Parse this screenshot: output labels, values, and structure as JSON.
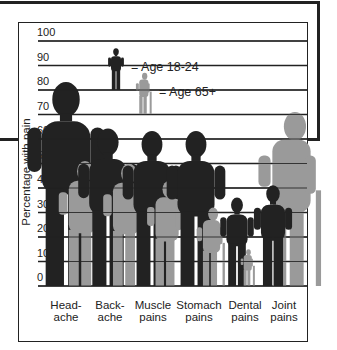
{
  "chart_data": {
    "type": "bar",
    "title": "",
    "xlabel": "",
    "ylabel": "Percentage with pain",
    "ylim": [
      0,
      100
    ],
    "yticks": [
      0,
      10,
      20,
      30,
      40,
      50,
      60,
      70,
      80,
      90,
      100
    ],
    "grid": true,
    "categories": [
      "Head-ache",
      "Back-ache",
      "Muscle pains",
      "Stomach pains",
      "Dental pains",
      "Joint pains"
    ],
    "category_lines": [
      [
        "Head-",
        "ache"
      ],
      [
        "Back-",
        "ache"
      ],
      [
        "Muscle",
        "pains"
      ],
      [
        "Stomach",
        "pains"
      ],
      [
        "Dental",
        "pains"
      ],
      [
        "Joint",
        "pains"
      ]
    ],
    "series": [
      {
        "name": "Age 18-24",
        "color": "#222222",
        "values": [
          83,
          64,
          63,
          63,
          36,
          41
        ]
      },
      {
        "name": "Age 65+",
        "color": "#9a9a9a",
        "values": [
          51,
          50,
          43,
          32,
          15,
          71
        ]
      }
    ],
    "legend": {
      "position": "top-inside",
      "entries": [
        "= Age 18-24",
        "= Age 65+"
      ]
    },
    "marker_style": "human silhouettes (pictogram)"
  }
}
